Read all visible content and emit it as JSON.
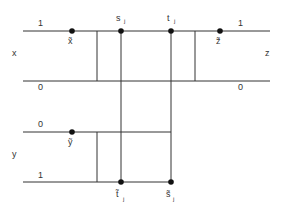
{
  "diagram": {
    "variables": {
      "x_label": "x",
      "y_label": "y",
      "z_label": "z"
    },
    "x_track": {
      "top_value": "1",
      "bottom_value": "0",
      "right_top_value": "1",
      "right_bottom_value": "0"
    },
    "y_track": {
      "top_value": "0",
      "bottom_value": "1"
    },
    "points": {
      "x_tilde": "x̃",
      "y_tilde": "ỹ",
      "z_tilde": "z̃",
      "s_j": "s",
      "s_j_sub": "j",
      "t_j": "t",
      "t_j_sub": "j",
      "t_tilde_j": "t̃",
      "t_tilde_j_sub": "j",
      "s_tilde_j": "s̃",
      "s_tilde_j_sub": "j"
    }
  }
}
